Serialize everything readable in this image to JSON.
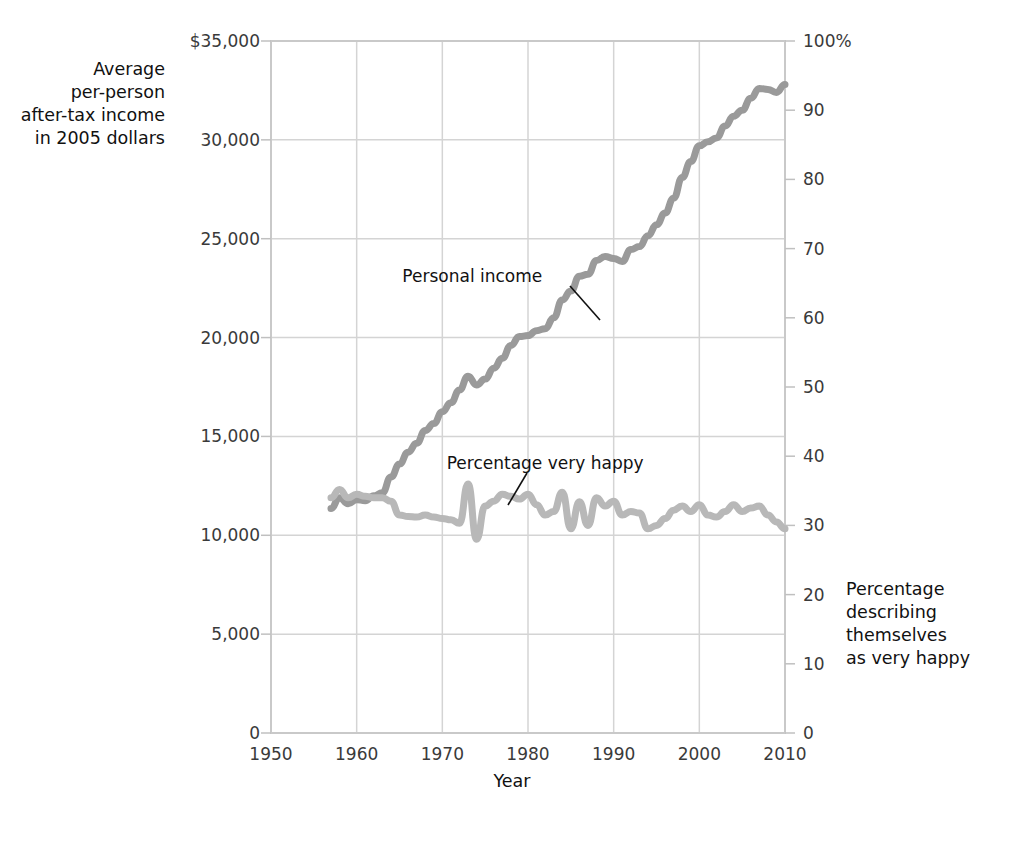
{
  "chart_data": {
    "type": "line",
    "title": "",
    "xlabel": "Year",
    "ylabel": "Average\nper-person\nafter-tax income\nin 2005 dollars",
    "ylabel_right": "Percentage\ndescribing\nthemselves\nas very happy",
    "xlim": [
      1950,
      2010
    ],
    "ylim": [
      0,
      35000
    ],
    "ylim_right": [
      0,
      100
    ],
    "grid": true,
    "legend": "none",
    "x_ticks": [
      "1950",
      "1960",
      "1970",
      "1980",
      "1990",
      "2000",
      "2010"
    ],
    "x_tick_values": [
      1950,
      1960,
      1970,
      1980,
      1990,
      2000,
      2010
    ],
    "y_ticks_left": [
      "$35,000",
      "30,000",
      "25,000",
      "20,000",
      "15,000",
      "10,000",
      "5,000",
      "0"
    ],
    "y_tick_values_left": [
      35000,
      30000,
      25000,
      20000,
      15000,
      10000,
      5000,
      0
    ],
    "y_ticks_right": [
      "100%",
      "90",
      "80",
      "70",
      "60",
      "50",
      "40",
      "30",
      "20",
      "10",
      "0"
    ],
    "y_tick_values_right": [
      100,
      90,
      80,
      70,
      60,
      50,
      40,
      30,
      20,
      10,
      0
    ],
    "annotations": [
      {
        "text": "Personal income",
        "x": 1973.5,
        "y_px": 276,
        "leader_from": [
          570,
          286
        ],
        "leader_to": [
          600,
          320
        ]
      },
      {
        "text": "Percentage very happy",
        "x": 1982.0,
        "y_px": 463,
        "leader_from": [
          527,
          473
        ],
        "leader_to": [
          508,
          505
        ]
      }
    ],
    "series": [
      {
        "name": "Personal income",
        "axis": "left",
        "color": "#9a9a9a",
        "units": "2005 dollars",
        "x": [
          1957,
          1958,
          1959,
          1960,
          1961,
          1962,
          1963,
          1964,
          1965,
          1966,
          1967,
          1968,
          1969,
          1970,
          1971,
          1972,
          1973,
          1974,
          1975,
          1976,
          1977,
          1978,
          1979,
          1980,
          1981,
          1982,
          1983,
          1984,
          1985,
          1986,
          1987,
          1988,
          1989,
          1990,
          1991,
          1992,
          1993,
          1994,
          1995,
          1996,
          1997,
          1998,
          1999,
          2000,
          2001,
          2002,
          2003,
          2004,
          2005,
          2006,
          2007,
          2008,
          2009,
          2010
        ],
        "y": [
          11350,
          11900,
          11600,
          11800,
          11750,
          12000,
          12150,
          12950,
          13600,
          14200,
          14650,
          15300,
          15650,
          16250,
          16700,
          17350,
          18050,
          17600,
          17900,
          18450,
          18950,
          19600,
          20050,
          20100,
          20350,
          20450,
          21000,
          21900,
          22350,
          23100,
          23200,
          23900,
          24100,
          24000,
          23850,
          24450,
          24600,
          25150,
          25700,
          26300,
          27050,
          28100,
          28900,
          29700,
          29900,
          30100,
          30700,
          31200,
          31500,
          32100,
          32600,
          32550,
          32400,
          32800
        ]
      },
      {
        "name": "Percentage very happy",
        "axis": "right",
        "color": "#b8b8b8",
        "units": "percent",
        "x": [
          1957,
          1958,
          1959,
          1960,
          1961,
          1962,
          1963,
          1964,
          1965,
          1966,
          1967,
          1968,
          1969,
          1970,
          1971,
          1972,
          1973,
          1974,
          1975,
          1976,
          1977,
          1978,
          1979,
          1980,
          1981,
          1982,
          1983,
          1984,
          1985,
          1986,
          1987,
          1988,
          1989,
          1990,
          1991,
          1992,
          1993,
          1994,
          1995,
          1996,
          1997,
          1998,
          1999,
          2000,
          2001,
          2002,
          2003,
          2004,
          2005,
          2006,
          2007,
          2008,
          2009,
          2010
        ],
        "y": [
          34.0,
          35.2,
          34.0,
          34.5,
          34.2,
          34.0,
          34.0,
          33.5,
          31.5,
          31.3,
          31.2,
          31.5,
          31.2,
          31.0,
          30.8,
          30.3,
          36.0,
          28.0,
          32.8,
          33.5,
          34.5,
          34.2,
          33.8,
          34.5,
          33.0,
          31.5,
          32.0,
          34.8,
          29.5,
          33.4,
          30.0,
          34.0,
          32.8,
          33.5,
          31.5,
          32.0,
          31.8,
          29.5,
          30.0,
          31.0,
          32.2,
          32.8,
          32.0,
          33.0,
          31.5,
          31.2,
          32.0,
          33.0,
          32.0,
          32.5,
          32.8,
          31.5,
          30.5,
          29.5
        ]
      }
    ]
  }
}
